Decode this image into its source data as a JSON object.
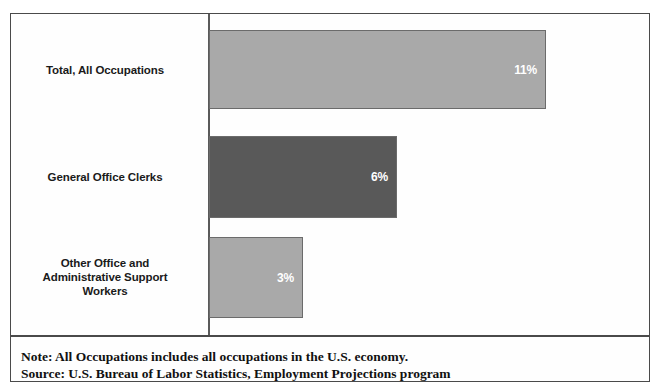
{
  "chart_data": {
    "type": "bar",
    "orientation": "horizontal",
    "title": "",
    "xlabel": "",
    "ylabel": "",
    "grid": false,
    "legend": "none",
    "xlim": [
      0,
      11
    ],
    "categories": [
      "Total, All Occupations",
      "General Office Clerks",
      "Other Office and Administrative Support Workers"
    ],
    "values": [
      11,
      6,
      3
    ],
    "value_labels": [
      "11%",
      "6%",
      "3%"
    ],
    "bars": [
      {
        "label_lines": [
          "Total, All Occupations"
        ],
        "value": 11,
        "value_label": "11%",
        "color": "#a9a9a9"
      },
      {
        "label_lines": [
          "General Office Clerks"
        ],
        "value": 6,
        "value_label": "6%",
        "color": "#595959"
      },
      {
        "label_lines": [
          "Other Office and",
          "Administrative Support",
          "Workers"
        ],
        "value": 3,
        "value_label": "3%",
        "color": "#a9a9a9"
      }
    ]
  },
  "footnote": {
    "note": "Note: All Occupations includes all occupations in the U.S. economy.",
    "source": "Source: U.S. Bureau of Labor Statistics, Employment Projections program"
  },
  "colors": {
    "bar_light": "#a9a9a9",
    "bar_dark": "#595959",
    "bar_border": "#6b6b6b",
    "frame": "#4a4a4a",
    "axis": "#5a5a5a",
    "value_text": "#ffffff",
    "label_text": "#1a1a1a",
    "footnote_text": "#111111",
    "background": "#ffffff"
  }
}
